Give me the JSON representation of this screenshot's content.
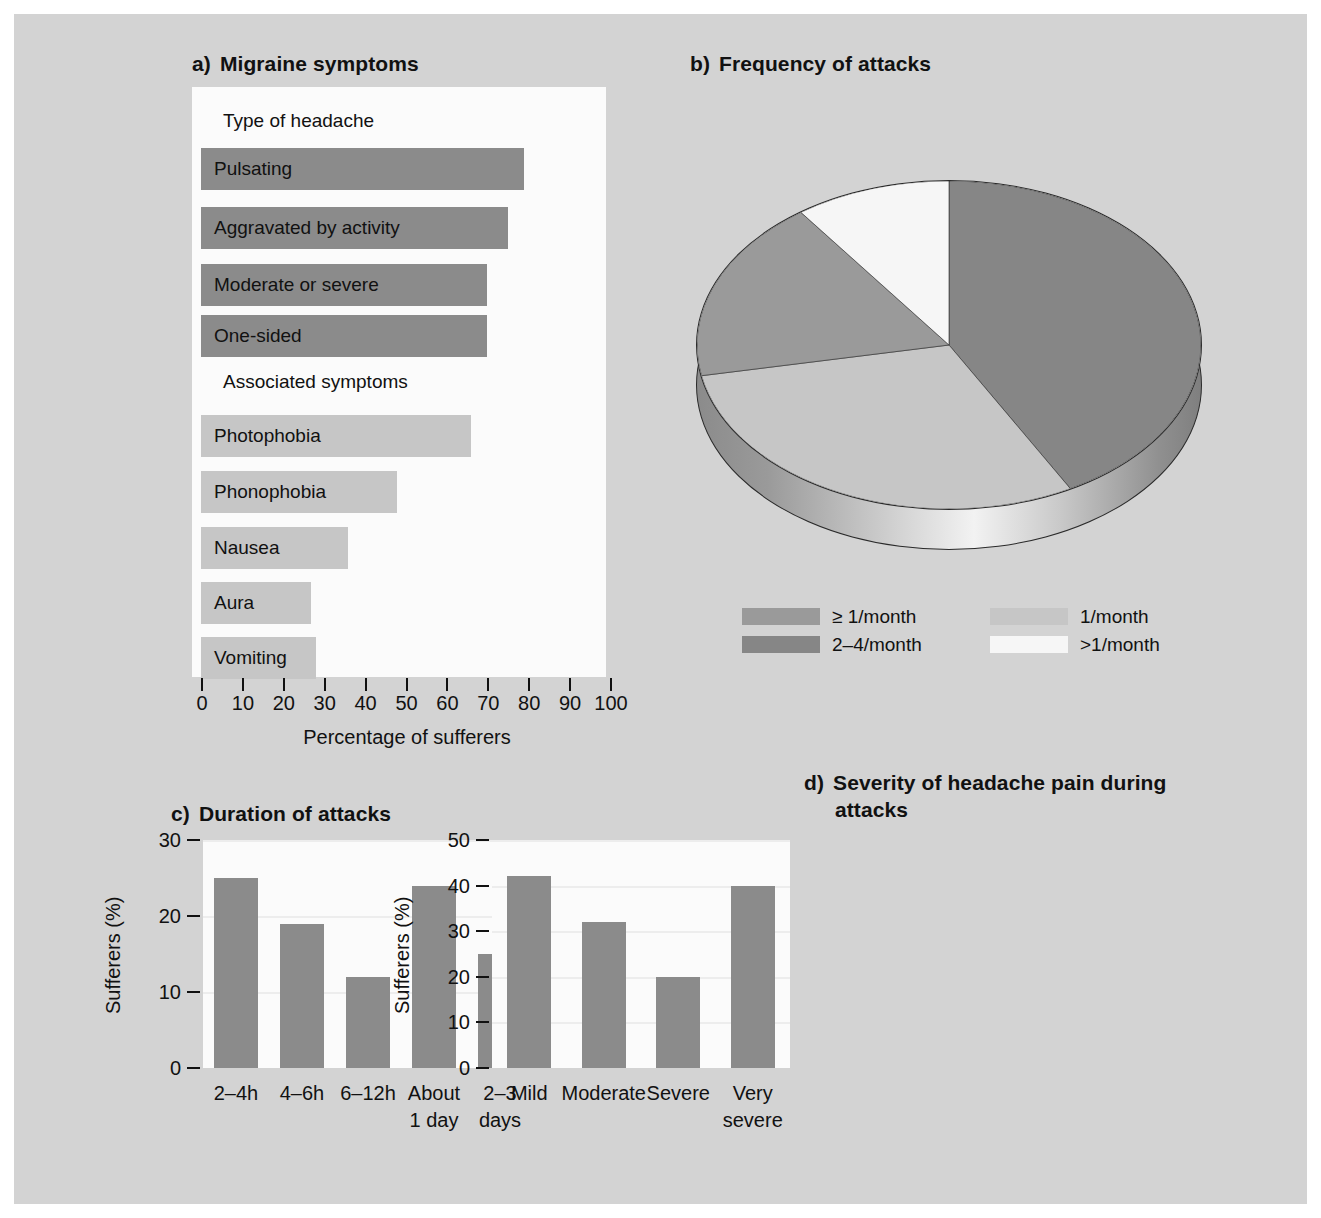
{
  "figure": {
    "background": "#d3d3d3",
    "plot_background": "#fbfbfb",
    "bar_dark": "#8b8b8b",
    "bar_light": "#c6c6c6"
  },
  "panel_a": {
    "tag": "a)",
    "title": "Migraine symptoms",
    "groups": [
      {
        "label": "Type of headache"
      },
      {
        "label": "Associated symptoms"
      }
    ],
    "xlabel": "Percentage of sufferers",
    "xticks": [
      "0",
      "10",
      "20",
      "30",
      "40",
      "50",
      "60",
      "70",
      "80",
      "90",
      "100"
    ]
  },
  "panel_b": {
    "tag": "b)",
    "title": "Frequency of attacks",
    "legend": [
      {
        "label": "≥ 1/month",
        "color": "#9a9a9a"
      },
      {
        "label": "2–4/month",
        "color": "#868686"
      },
      {
        "label": "1/month",
        "color": "#c6c6c6"
      },
      {
        "label": ">1/month",
        "color": "#f6f6f6"
      }
    ]
  },
  "panel_c": {
    "tag": "c)",
    "title": "Duration of attacks",
    "ylabel": "Sufferers (%)",
    "yticks": [
      "0",
      "10",
      "20",
      "30"
    ]
  },
  "panel_d": {
    "tag": "d)",
    "title_line1": "Severity of headache pain during",
    "title_line2": "attacks",
    "ylabel": "Sufferers (%)",
    "yticks": [
      "0",
      "10",
      "20",
      "30",
      "40",
      "50"
    ]
  },
  "chart_data": [
    {
      "type": "bar",
      "orientation": "horizontal",
      "panel": "a",
      "title": "Migraine symptoms",
      "xlabel": "Percentage of sufferers",
      "ylabel": "",
      "xlim": [
        0,
        100
      ],
      "grid": false,
      "group_headings": [
        "Type of headache",
        "Associated symptoms"
      ],
      "categories": [
        "Pulsating",
        "Aggravated by activity",
        "Moderate or severe",
        "One-sided",
        "Photophobia",
        "Phonophobia",
        "Nausea",
        "Aura",
        "Vomiting"
      ],
      "values": [
        79,
        75,
        70,
        70,
        66,
        48,
        36,
        27,
        28
      ],
      "bar_groups": [
        "Type of headache",
        "Type of headache",
        "Type of headache",
        "Type of headache",
        "Associated symptoms",
        "Associated symptoms",
        "Associated symptoms",
        "Associated symptoms",
        "Associated symptoms"
      ],
      "bar_colors": [
        "#8b8b8b",
        "#8b8b8b",
        "#8b8b8b",
        "#8b8b8b",
        "#c6c6c6",
        "#c6c6c6",
        "#c6c6c6",
        "#c6c6c6",
        "#c6c6c6"
      ]
    },
    {
      "type": "pie",
      "panel": "b",
      "title": "Frequency of attacks",
      "legend_position": "bottom",
      "labels": [
        "2–4/month",
        "1/month",
        "≥ 1/month",
        ">1/month"
      ],
      "values": [
        42,
        30,
        18,
        10
      ],
      "colors": [
        "#868686",
        "#c6c6c6",
        "#9a9a9a",
        "#f6f6f6"
      ],
      "style": "3d-exploded-disc"
    },
    {
      "type": "bar",
      "orientation": "vertical",
      "panel": "c",
      "title": "Duration of attacks",
      "xlabel": "",
      "ylabel": "Sufferers (%)",
      "ylim": [
        0,
        30
      ],
      "grid": true,
      "categories": [
        "2–4h",
        "4–6h",
        "6–12h",
        "About 1 day",
        "2–3 days"
      ],
      "values": [
        25,
        19,
        12,
        24,
        15
      ]
    },
    {
      "type": "bar",
      "orientation": "vertical",
      "panel": "d",
      "title": "Severity of headache pain during attacks",
      "xlabel": "",
      "ylabel": "Sufferers (%)",
      "ylim": [
        0,
        50
      ],
      "grid": true,
      "categories": [
        "Mild",
        "Moderate",
        "Severe",
        "Very severe"
      ],
      "values": [
        42,
        32,
        20,
        40
      ]
    }
  ]
}
